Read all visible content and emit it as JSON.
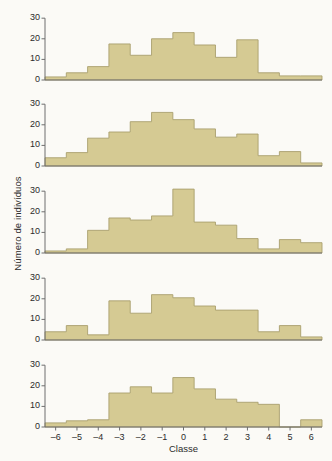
{
  "figure": {
    "kind": "histogram-panel-stack",
    "panel_count": 5,
    "background_color": "#fbfaf6",
    "bar_fill_color": "#d5ca93",
    "bar_edge_color": "#a99f6e",
    "axis_color": "#6e6e6e",
    "text_color": "#2b2b2b"
  },
  "axes": {
    "xlabel": "Classe",
    "ylabel": "Número de indivíduos",
    "xlim": [
      -6.5,
      6.5
    ],
    "ylim": [
      0,
      33
    ],
    "yticks": [
      0,
      10,
      20,
      30
    ],
    "ytick_labels": [
      "0",
      "10",
      "20",
      "30"
    ],
    "xticks": [
      -6,
      -5,
      -4,
      -3,
      -2,
      -1,
      0,
      1,
      2,
      3,
      4,
      5,
      6
    ],
    "xtick_labels": [
      "–6",
      "–5",
      "–4",
      "–3",
      "–2",
      "–1",
      "0",
      "1",
      "2",
      "3",
      "4",
      "5",
      "6"
    ],
    "grid": false
  },
  "chart_data": {
    "type": "bar",
    "title": "",
    "xlabel": "Classe",
    "ylabel": "Número de indivíduos",
    "ylim": [
      0,
      33
    ],
    "xlim": [
      -6.5,
      6.5
    ],
    "grid": false,
    "legend": null,
    "categories": [
      -6,
      -5,
      -4,
      -3,
      -2,
      -1,
      0,
      1,
      2,
      3,
      4,
      5,
      6
    ],
    "bin_width": 1,
    "panels": [
      {
        "index": 1,
        "values": [
          1.5,
          3.5,
          6.5,
          17.5,
          12,
          20,
          23,
          17,
          11,
          19.5,
          3.5,
          2,
          2
        ]
      },
      {
        "index": 2,
        "values": [
          4,
          6.5,
          13.5,
          16.5,
          21.5,
          26,
          22.5,
          18,
          14,
          15.5,
          5,
          7,
          1.5
        ]
      },
      {
        "index": 3,
        "values": [
          1,
          2,
          11,
          17,
          16,
          18,
          31,
          15,
          13.5,
          7,
          2,
          6.5,
          5
        ]
      },
      {
        "index": 4,
        "values": [
          4,
          7,
          2.5,
          19,
          13,
          22,
          20.5,
          16.5,
          14.5,
          14.5,
          4,
          7,
          1.5
        ]
      },
      {
        "index": 5,
        "values": [
          2,
          3,
          3.5,
          16.5,
          19.5,
          16.5,
          24,
          18.5,
          13.5,
          12,
          11,
          0,
          3.5
        ]
      }
    ]
  }
}
